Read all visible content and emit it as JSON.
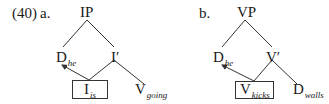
{
  "example": {
    "number": "(40)",
    "trees": [
      {
        "label": "a.",
        "root": "IP",
        "specifier": {
          "head": "D",
          "sub": "he"
        },
        "bar": "I′",
        "boxed": {
          "head": "I",
          "sub": "is"
        },
        "complement": {
          "head": "V",
          "sub": "going"
        }
      },
      {
        "label": "b.",
        "root": "VP",
        "specifier": {
          "head": "D",
          "sub": "he"
        },
        "bar": "V′",
        "boxed": {
          "head": "V",
          "sub": "kicks"
        },
        "complement": {
          "head": "D",
          "sub": "walls"
        }
      }
    ]
  }
}
